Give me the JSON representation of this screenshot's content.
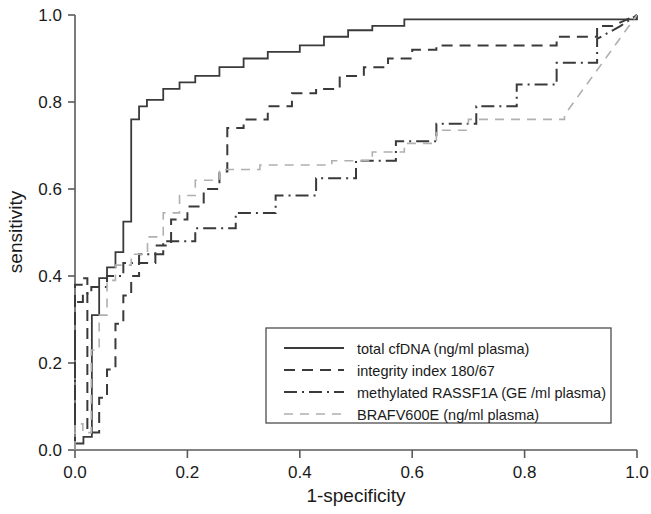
{
  "chart_data": {
    "type": "line",
    "title": "",
    "xlabel": "1-specificity",
    "ylabel": "sensitivity",
    "xlim": [
      0.0,
      1.0
    ],
    "ylim": [
      0.0,
      1.0
    ],
    "xticks": [
      "0.0",
      "0.2",
      "0.4",
      "0.6",
      "0.8",
      "1.0"
    ],
    "xtick_values": [
      0.0,
      0.2,
      0.4,
      0.6,
      0.8,
      1.0
    ],
    "yticks": [
      "0.0",
      "0.2",
      "0.4",
      "0.6",
      "0.8",
      "1.0"
    ],
    "ytick_values": [
      0.0,
      0.2,
      0.4,
      0.6,
      0.8,
      1.0
    ],
    "grid": false,
    "legend_position": "lower-right-inside",
    "series": [
      {
        "name": "total cfDNA (ng/ml plasma)",
        "style": "solid",
        "color": "#3a3a3a",
        "points": [
          [
            0.0,
            0.0
          ],
          [
            0.0,
            0.015
          ],
          [
            0.015,
            0.015
          ],
          [
            0.015,
            0.03
          ],
          [
            0.03,
            0.03
          ],
          [
            0.03,
            0.31
          ],
          [
            0.043,
            0.31
          ],
          [
            0.043,
            0.395
          ],
          [
            0.057,
            0.395
          ],
          [
            0.057,
            0.42
          ],
          [
            0.072,
            0.42
          ],
          [
            0.072,
            0.455
          ],
          [
            0.086,
            0.455
          ],
          [
            0.086,
            0.525
          ],
          [
            0.1,
            0.525
          ],
          [
            0.1,
            0.76
          ],
          [
            0.114,
            0.76
          ],
          [
            0.114,
            0.79
          ],
          [
            0.128,
            0.79
          ],
          [
            0.128,
            0.805
          ],
          [
            0.157,
            0.805
          ],
          [
            0.157,
            0.83
          ],
          [
            0.186,
            0.83
          ],
          [
            0.186,
            0.845
          ],
          [
            0.214,
            0.845
          ],
          [
            0.214,
            0.86
          ],
          [
            0.257,
            0.86
          ],
          [
            0.257,
            0.88
          ],
          [
            0.3,
            0.88
          ],
          [
            0.3,
            0.9
          ],
          [
            0.343,
            0.9
          ],
          [
            0.343,
            0.915
          ],
          [
            0.4,
            0.915
          ],
          [
            0.4,
            0.93
          ],
          [
            0.443,
            0.93
          ],
          [
            0.443,
            0.95
          ],
          [
            0.486,
            0.95
          ],
          [
            0.486,
            0.965
          ],
          [
            0.529,
            0.965
          ],
          [
            0.529,
            0.975
          ],
          [
            0.586,
            0.975
          ],
          [
            0.586,
            0.99
          ],
          [
            0.629,
            0.99
          ],
          [
            1.0,
            0.99
          ],
          [
            1.0,
            1.0
          ]
        ]
      },
      {
        "name": "integrity index 180/67",
        "style": "dashed",
        "color": "#3a3a3a",
        "points": [
          [
            0.0,
            0.0
          ],
          [
            0.0,
            0.38
          ],
          [
            0.014,
            0.38
          ],
          [
            0.014,
            0.395
          ],
          [
            0.022,
            0.395
          ],
          [
            0.022,
            0.04
          ],
          [
            0.043,
            0.04
          ],
          [
            0.043,
            0.12
          ],
          [
            0.057,
            0.12
          ],
          [
            0.057,
            0.185
          ],
          [
            0.072,
            0.185
          ],
          [
            0.072,
            0.29
          ],
          [
            0.086,
            0.29
          ],
          [
            0.086,
            0.355
          ],
          [
            0.1,
            0.355
          ],
          [
            0.1,
            0.4
          ],
          [
            0.114,
            0.4
          ],
          [
            0.114,
            0.43
          ],
          [
            0.143,
            0.43
          ],
          [
            0.143,
            0.47
          ],
          [
            0.171,
            0.47
          ],
          [
            0.171,
            0.53
          ],
          [
            0.2,
            0.53
          ],
          [
            0.2,
            0.56
          ],
          [
            0.229,
            0.56
          ],
          [
            0.229,
            0.6
          ],
          [
            0.257,
            0.6
          ],
          [
            0.257,
            0.64
          ],
          [
            0.271,
            0.64
          ],
          [
            0.271,
            0.74
          ],
          [
            0.3,
            0.74
          ],
          [
            0.3,
            0.76
          ],
          [
            0.343,
            0.76
          ],
          [
            0.343,
            0.79
          ],
          [
            0.386,
            0.79
          ],
          [
            0.386,
            0.82
          ],
          [
            0.429,
            0.82
          ],
          [
            0.429,
            0.83
          ],
          [
            0.471,
            0.83
          ],
          [
            0.471,
            0.86
          ],
          [
            0.514,
            0.86
          ],
          [
            0.514,
            0.88
          ],
          [
            0.557,
            0.88
          ],
          [
            0.557,
            0.9
          ],
          [
            0.6,
            0.9
          ],
          [
            0.6,
            0.92
          ],
          [
            0.643,
            0.92
          ],
          [
            0.643,
            0.93
          ],
          [
            0.857,
            0.93
          ],
          [
            0.857,
            0.95
          ],
          [
            0.929,
            0.95
          ],
          [
            0.929,
            0.975
          ],
          [
            0.957,
            0.975
          ],
          [
            1.0,
            1.0
          ]
        ]
      },
      {
        "name": "methylated RASSF1A (GE /ml plasma)",
        "style": "dashdot",
        "color": "#3a3a3a",
        "points": [
          [
            0.0,
            0.0
          ],
          [
            0.0,
            0.34
          ],
          [
            0.014,
            0.34
          ],
          [
            0.014,
            0.36
          ],
          [
            0.029,
            0.36
          ],
          [
            0.029,
            0.375
          ],
          [
            0.057,
            0.375
          ],
          [
            0.057,
            0.4
          ],
          [
            0.086,
            0.4
          ],
          [
            0.086,
            0.43
          ],
          [
            0.114,
            0.43
          ],
          [
            0.114,
            0.45
          ],
          [
            0.157,
            0.45
          ],
          [
            0.157,
            0.48
          ],
          [
            0.214,
            0.48
          ],
          [
            0.214,
            0.51
          ],
          [
            0.286,
            0.51
          ],
          [
            0.286,
            0.545
          ],
          [
            0.357,
            0.545
          ],
          [
            0.357,
            0.585
          ],
          [
            0.429,
            0.585
          ],
          [
            0.429,
            0.625
          ],
          [
            0.5,
            0.625
          ],
          [
            0.5,
            0.665
          ],
          [
            0.571,
            0.665
          ],
          [
            0.571,
            0.71
          ],
          [
            0.643,
            0.71
          ],
          [
            0.643,
            0.75
          ],
          [
            0.714,
            0.75
          ],
          [
            0.714,
            0.79
          ],
          [
            0.786,
            0.79
          ],
          [
            0.786,
            0.84
          ],
          [
            0.857,
            0.84
          ],
          [
            0.857,
            0.89
          ],
          [
            0.929,
            0.89
          ],
          [
            0.929,
            0.945
          ],
          [
            0.971,
            0.975
          ],
          [
            1.0,
            1.0
          ]
        ]
      },
      {
        "name": "BRAFV600E (ng/ml plasma)",
        "style": "dashed-light",
        "color": "#b0b0b0",
        "points": [
          [
            0.0,
            0.0
          ],
          [
            0.0,
            0.06
          ],
          [
            0.014,
            0.06
          ],
          [
            0.014,
            0.04
          ],
          [
            0.029,
            0.04
          ],
          [
            0.029,
            0.23
          ],
          [
            0.043,
            0.23
          ],
          [
            0.043,
            0.31
          ],
          [
            0.057,
            0.31
          ],
          [
            0.057,
            0.39
          ],
          [
            0.072,
            0.39
          ],
          [
            0.072,
            0.425
          ],
          [
            0.1,
            0.425
          ],
          [
            0.1,
            0.45
          ],
          [
            0.129,
            0.45
          ],
          [
            0.129,
            0.49
          ],
          [
            0.157,
            0.49
          ],
          [
            0.157,
            0.545
          ],
          [
            0.186,
            0.545
          ],
          [
            0.186,
            0.585
          ],
          [
            0.214,
            0.585
          ],
          [
            0.214,
            0.62
          ],
          [
            0.257,
            0.62
          ],
          [
            0.257,
            0.645
          ],
          [
            0.329,
            0.645
          ],
          [
            0.329,
            0.655
          ],
          [
            0.457,
            0.655
          ],
          [
            0.457,
            0.665
          ],
          [
            0.529,
            0.665
          ],
          [
            0.529,
            0.685
          ],
          [
            0.586,
            0.685
          ],
          [
            0.586,
            0.705
          ],
          [
            0.643,
            0.705
          ],
          [
            0.643,
            0.735
          ],
          [
            0.7,
            0.735
          ],
          [
            0.7,
            0.76
          ],
          [
            0.871,
            0.76
          ],
          [
            0.871,
            0.77
          ],
          [
            1.0,
            1.0
          ]
        ]
      }
    ]
  },
  "legend": {
    "items": [
      {
        "label": "total cfDNA (ng/ml plasma)",
        "style": "solid"
      },
      {
        "label": "integrity index 180/67",
        "style": "dashed"
      },
      {
        "label": "methylated RASSF1A (GE /ml plasma)",
        "style": "dashdot"
      },
      {
        "label": "BRAFV600E (ng/ml plasma)",
        "style": "dashed-light"
      }
    ]
  },
  "colors": {
    "axis": "#5a5a5a",
    "curve_dark": "#3a3a3a",
    "curve_light": "#b0b0b0",
    "text": "#1a1a1a",
    "background": "#ffffff"
  }
}
